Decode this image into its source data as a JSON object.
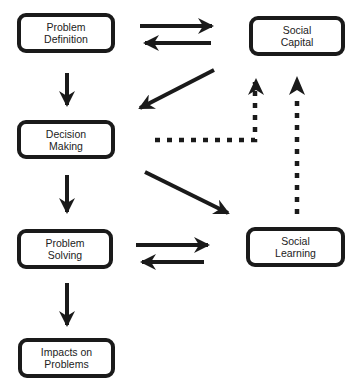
{
  "diagram": {
    "nodes": [
      {
        "id": "problem-definition",
        "line1": "Problem",
        "line2": "Definition"
      },
      {
        "id": "social-capital",
        "line1": "Social",
        "line2": "Capital"
      },
      {
        "id": "decision-making",
        "line1": "Decision",
        "line2": "Making"
      },
      {
        "id": "problem-solving",
        "line1": "Problem",
        "line2": "Solving"
      },
      {
        "id": "social-learning",
        "line1": "Social",
        "line2": "Learning"
      },
      {
        "id": "impacts-on-problems",
        "line1": "Impacts on",
        "line2": "Problems"
      }
    ],
    "edges": [
      {
        "from": "problem-definition",
        "to": "social-capital",
        "style": "solid"
      },
      {
        "from": "social-capital",
        "to": "problem-definition",
        "style": "solid"
      },
      {
        "from": "problem-definition",
        "to": "decision-making",
        "style": "solid"
      },
      {
        "from": "social-capital",
        "to": "decision-making",
        "style": "solid"
      },
      {
        "from": "decision-making",
        "to": "social-capital",
        "style": "dotted"
      },
      {
        "from": "decision-making",
        "to": "problem-solving",
        "style": "solid"
      },
      {
        "from": "decision-making",
        "to": "social-learning",
        "style": "solid"
      },
      {
        "from": "social-learning",
        "to": "social-capital",
        "style": "dotted"
      },
      {
        "from": "problem-solving",
        "to": "social-learning",
        "style": "solid"
      },
      {
        "from": "social-learning",
        "to": "problem-solving",
        "style": "solid"
      },
      {
        "from": "problem-solving",
        "to": "impacts-on-problems",
        "style": "solid"
      }
    ],
    "colors": {
      "stroke": "#1a1a1a",
      "text": "#222222",
      "background": "#ffffff"
    }
  }
}
